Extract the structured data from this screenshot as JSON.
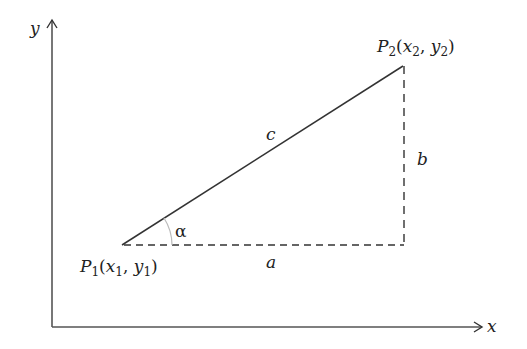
{
  "diagram": {
    "type": "right-triangle-distance",
    "colors": {
      "line": "#333333",
      "axis": "#555555",
      "angle_arc": "#bbbbbb",
      "text": "#222222",
      "background": "#ffffff"
    },
    "axes": {
      "x_label": "x",
      "y_label": "y"
    },
    "points": {
      "p1": {
        "name": "P",
        "sub": "1",
        "coord_x": "x",
        "coord_x_sub": "1",
        "coord_y": "y",
        "coord_y_sub": "1"
      },
      "p2": {
        "name": "P",
        "sub": "2",
        "coord_x": "x",
        "coord_x_sub": "2",
        "coord_y": "y",
        "coord_y_sub": "2"
      }
    },
    "sides": {
      "hypotenuse": "c",
      "horizontal": "a",
      "vertical": "b"
    },
    "angle": {
      "label": "α"
    },
    "punct": {
      "open": "(",
      "comma": ", ",
      "close": ")"
    }
  }
}
